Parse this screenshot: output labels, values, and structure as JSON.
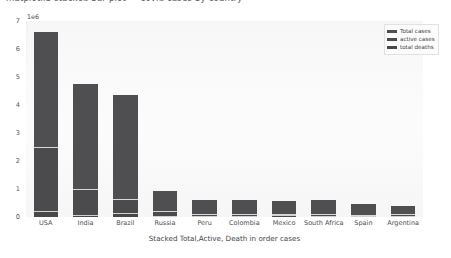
{
  "top_strip": {
    "clipped_text": "matplotlib stacked bar plot — covid cases by country"
  },
  "chart_data": {
    "type": "bar",
    "stacked": true,
    "title": "",
    "xlabel": "Stacked Total,Active, Death in order cases",
    "ylabel": "",
    "y_multiplier_label": "1e6",
    "y_multiplier_value": 1000000,
    "ylim": [
      0,
      7
    ],
    "yticks": [
      0,
      1,
      2,
      3,
      4,
      5,
      6,
      7
    ],
    "ytick_labels": [
      "0",
      "1",
      "2",
      "3",
      "4",
      "5",
      "6",
      "7"
    ],
    "grid": false,
    "legend_position": "upper right",
    "categories": [
      "USA",
      "India",
      "Brazil",
      "Russia",
      "Peru",
      "Colombia",
      "Mexico",
      "South Africa",
      "Spain",
      "Argentina"
    ],
    "series": [
      {
        "name": "Total cases",
        "color": "#4f4f52",
        "values": [
          6.6,
          4.75,
          4.35,
          0.93,
          0.62,
          0.62,
          0.58,
          0.6,
          0.47,
          0.39
        ]
      },
      {
        "name": "active cases",
        "color": "#4b4b4e",
        "values": [
          2.5,
          1.0,
          0.65,
          0.22,
          0.1,
          0.12,
          0.1,
          0.11,
          0.06,
          0.09
        ]
      },
      {
        "name": "total deaths",
        "color": "#474749",
        "values": [
          0.2,
          0.08,
          0.13,
          0.02,
          0.03,
          0.02,
          0.06,
          0.01,
          0.03,
          0.01
        ]
      }
    ]
  },
  "legend": {
    "entries": [
      {
        "label": "Total cases",
        "color": "#4f4f52"
      },
      {
        "label": "active cases",
        "color": "#4b4b4e"
      },
      {
        "label": "total deaths",
        "color": "#474749"
      }
    ]
  }
}
